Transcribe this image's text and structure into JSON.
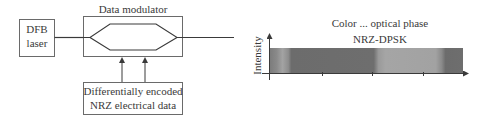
{
  "laser": {
    "label_line1": "DFB",
    "label_line2": "laser"
  },
  "modulator": {
    "title": "Data modulator"
  },
  "data_source": {
    "line1": "Differentially encoded",
    "line2": "NRZ electrical data"
  },
  "plot": {
    "title_line1": "Color ... optical phase",
    "title_line2": "NRZ-DPSK",
    "ylabel": "Intensity"
  },
  "colors": {
    "line": "#4a4a4a",
    "bar_dark": "#707070",
    "bar_light": "#a0a0a0"
  }
}
